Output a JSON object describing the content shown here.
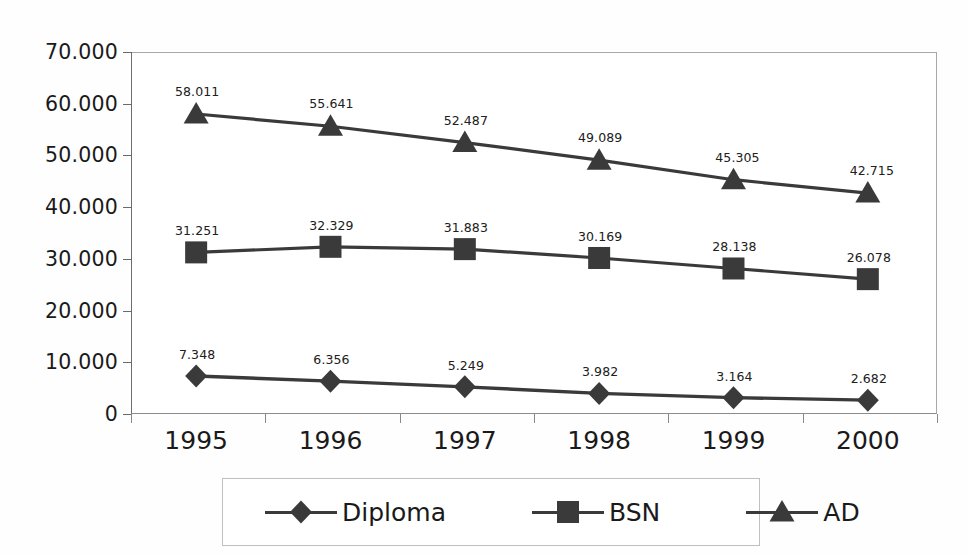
{
  "chart_data": {
    "type": "line",
    "title": "",
    "subtitle": "",
    "xlabel": "",
    "ylabel": "",
    "categories": [
      "1995",
      "1996",
      "1997",
      "1998",
      "1999",
      "2000"
    ],
    "ylim": [
      0,
      70000
    ],
    "ytick_labels": [
      "70.000",
      "60.000",
      "50.000",
      "40.000",
      "30.000",
      "20.000",
      "10.000",
      "0"
    ],
    "ytick_values": [
      70000,
      60000,
      50000,
      40000,
      30000,
      20000,
      10000,
      0
    ],
    "grid": false,
    "legend_position": "bottom",
    "series": [
      {
        "name": "Diploma",
        "marker": "diamond",
        "color": "#3a3a3a",
        "values": [
          7348,
          6356,
          5249,
          3982,
          3164,
          2682
        ],
        "labels": [
          "7.348",
          "6.356",
          "5.249",
          "3.982",
          "3.164",
          "2.682"
        ]
      },
      {
        "name": "BSN",
        "marker": "square",
        "color": "#3a3a3a",
        "values": [
          31251,
          32329,
          31883,
          30169,
          28138,
          26078
        ],
        "labels": [
          "31.251",
          "32.329",
          "31.883",
          "30.169",
          "28.138",
          "26.078"
        ]
      },
      {
        "name": "AD",
        "marker": "triangle",
        "color": "#3a3a3a",
        "values": [
          58011,
          55641,
          52487,
          49089,
          45305,
          42715
        ],
        "labels": [
          "58.011",
          "55.641",
          "52.487",
          "49.089",
          "45.305",
          "42.715"
        ]
      }
    ]
  },
  "legend": {
    "items": [
      {
        "label": "Diploma",
        "marker": "diamond-icon"
      },
      {
        "label": "BSN",
        "marker": "square-icon"
      },
      {
        "label": "AD",
        "marker": "triangle-icon"
      }
    ]
  }
}
